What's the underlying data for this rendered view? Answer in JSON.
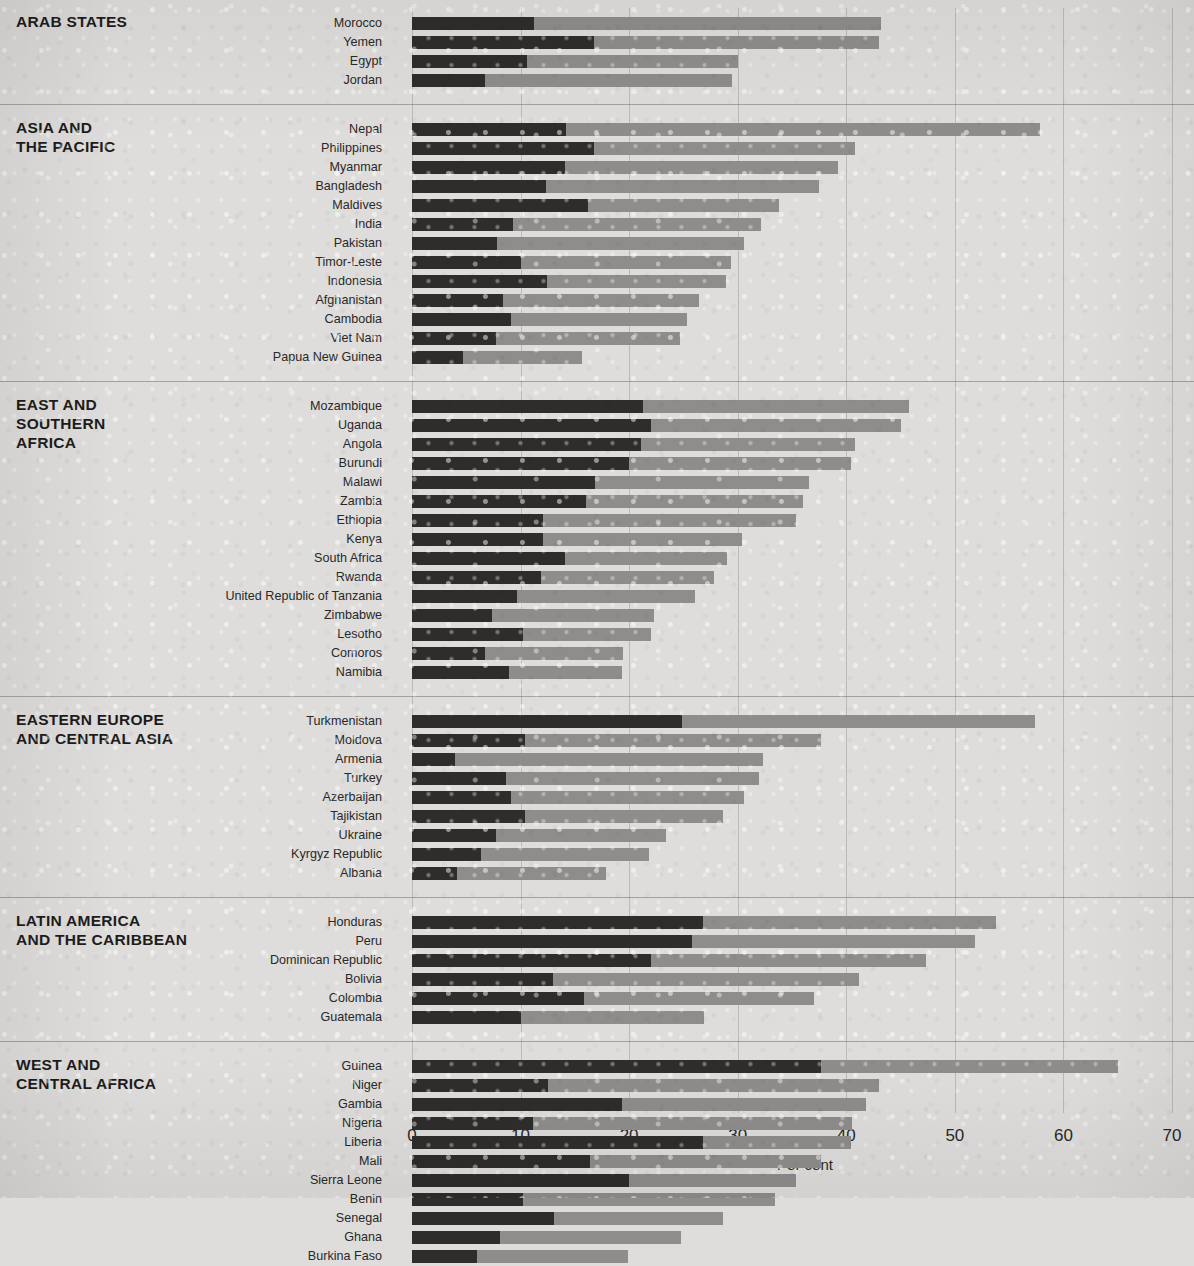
{
  "axis": {
    "title": "Per cent",
    "ticks": [
      0,
      10,
      20,
      30,
      40,
      50,
      60,
      70
    ],
    "min": 0,
    "max": 70
  },
  "colors": {
    "dark": "#2f2d2c",
    "light": "#8e8d8b",
    "background": "#dedddb",
    "rule": "#9a9a9a"
  },
  "chart_data": {
    "type": "bar",
    "orientation": "horizontal",
    "stacked": true,
    "title": "",
    "xlabel": "Per cent",
    "ylabel": "",
    "xlim": [
      0,
      70
    ],
    "xticks": [
      0,
      10,
      20,
      30,
      40,
      50,
      60,
      70
    ],
    "grid": "vertical",
    "legend": "none",
    "series": [
      {
        "name": "dark-segment",
        "color": "#2f2d2c"
      },
      {
        "name": "light-segment",
        "color": "#8e8d8b"
      }
    ],
    "groups": [
      {
        "region": "ARAB STATES",
        "rows": [
          {
            "label": "Morocco",
            "dark": 11.2,
            "total": 43.2
          },
          {
            "label": "Yemen",
            "dark": 16.8,
            "total": 43.0
          },
          {
            "label": "Egypt",
            "dark": 10.6,
            "total": 30.0
          },
          {
            "label": "Jordan",
            "dark": 6.7,
            "total": 29.5
          }
        ]
      },
      {
        "region": "ASIA AND\nTHE PACIFIC",
        "rows": [
          {
            "label": "Nepal",
            "dark": 14.2,
            "total": 57.8
          },
          {
            "label": "Philippines",
            "dark": 16.8,
            "total": 40.8
          },
          {
            "label": "Myanmar",
            "dark": 14.1,
            "total": 39.2
          },
          {
            "label": "Bangladesh",
            "dark": 12.3,
            "total": 37.5
          },
          {
            "label": "Maldives",
            "dark": 16.2,
            "total": 33.8
          },
          {
            "label": "India",
            "dark": 9.3,
            "total": 32.1
          },
          {
            "label": "Pakistan",
            "dark": 7.8,
            "total": 30.6
          },
          {
            "label": "Timor-Leste",
            "dark": 10.0,
            "total": 29.4
          },
          {
            "label": "Indonesia",
            "dark": 12.4,
            "total": 28.9
          },
          {
            "label": "Afghanistan",
            "dark": 8.4,
            "total": 26.4
          },
          {
            "label": "Cambodia",
            "dark": 9.1,
            "total": 25.3
          },
          {
            "label": "Viet Nam",
            "dark": 7.7,
            "total": 24.7
          },
          {
            "label": "Papua New Guinea",
            "dark": 4.7,
            "total": 15.7
          }
        ]
      },
      {
        "region": "EAST AND\nSOUTHERN\nAFRICA",
        "rows": [
          {
            "label": "Mozambique",
            "dark": 21.3,
            "total": 45.8
          },
          {
            "label": "Uganda",
            "dark": 22.0,
            "total": 45.0
          },
          {
            "label": "Angola",
            "dark": 21.1,
            "total": 40.8
          },
          {
            "label": "Burundi",
            "dark": 20.0,
            "total": 40.4
          },
          {
            "label": "Malawi",
            "dark": 16.9,
            "total": 36.6
          },
          {
            "label": "Zambia",
            "dark": 16.0,
            "total": 36.0
          },
          {
            "label": "Ethiopia",
            "dark": 12.1,
            "total": 35.4
          },
          {
            "label": "Kenya",
            "dark": 12.1,
            "total": 30.4
          },
          {
            "label": "South Africa",
            "dark": 14.1,
            "total": 29.0
          },
          {
            "label": "Rwanda",
            "dark": 11.9,
            "total": 27.8
          },
          {
            "label": "United Republic of Tanzania",
            "dark": 9.7,
            "total": 26.1
          },
          {
            "label": "Zimbabwe",
            "dark": 7.4,
            "total": 22.3
          },
          {
            "label": "Lesotho",
            "dark": 10.2,
            "total": 22.0
          },
          {
            "label": "Comoros",
            "dark": 6.7,
            "total": 19.4
          },
          {
            "label": "Namibia",
            "dark": 8.9,
            "total": 19.3
          }
        ]
      },
      {
        "region": "EASTERN EUROPE\nAND CENTRAL ASIA",
        "rows": [
          {
            "label": "Turkmenistan",
            "dark": 24.9,
            "total": 57.4
          },
          {
            "label": "Moldova",
            "dark": 10.4,
            "total": 37.7
          },
          {
            "label": "Armenia",
            "dark": 4.0,
            "total": 32.3
          },
          {
            "label": "Turkey",
            "dark": 8.7,
            "total": 32.0
          },
          {
            "label": "Azerbaijan",
            "dark": 9.1,
            "total": 30.6
          },
          {
            "label": "Tajikistan",
            "dark": 10.4,
            "total": 28.6
          },
          {
            "label": "Ukraine",
            "dark": 7.7,
            "total": 23.4
          },
          {
            "label": "Kyrgyz Republic",
            "dark": 6.4,
            "total": 21.8
          },
          {
            "label": "Albania",
            "dark": 4.1,
            "total": 17.9
          }
        ]
      },
      {
        "region": "LATIN AMERICA\nAND THE CARIBBEAN",
        "rows": [
          {
            "label": "Honduras",
            "dark": 26.8,
            "total": 53.8
          },
          {
            "label": "Peru",
            "dark": 25.8,
            "total": 51.9
          },
          {
            "label": "Dominican Republic",
            "dark": 22.0,
            "total": 47.3
          },
          {
            "label": "Bolivia",
            "dark": 13.0,
            "total": 41.2
          },
          {
            "label": "Colombia",
            "dark": 15.8,
            "total": 37.0
          },
          {
            "label": "Guatemala",
            "dark": 10.0,
            "total": 26.9
          }
        ]
      },
      {
        "region": "WEST AND\nCENTRAL AFRICA",
        "rows": [
          {
            "label": "Guinea",
            "dark": 37.7,
            "total": 65.0
          },
          {
            "label": "Niger",
            "dark": 12.5,
            "total": 43.0
          },
          {
            "label": "Gambia",
            "dark": 19.3,
            "total": 41.8
          },
          {
            "label": "Nigeria",
            "dark": 11.1,
            "total": 40.5
          },
          {
            "label": "Liberia",
            "dark": 26.8,
            "total": 40.4
          },
          {
            "label": "Mali",
            "dark": 16.4,
            "total": 37.7
          },
          {
            "label": "Sierra Leone",
            "dark": 20.0,
            "total": 35.4
          },
          {
            "label": "Benin",
            "dark": 10.2,
            "total": 33.4
          },
          {
            "label": "Senegal",
            "dark": 13.1,
            "total": 28.6
          },
          {
            "label": "Ghana",
            "dark": 8.1,
            "total": 24.8
          },
          {
            "label": "Burkina Faso",
            "dark": 6.0,
            "total": 19.9
          }
        ]
      }
    ]
  }
}
